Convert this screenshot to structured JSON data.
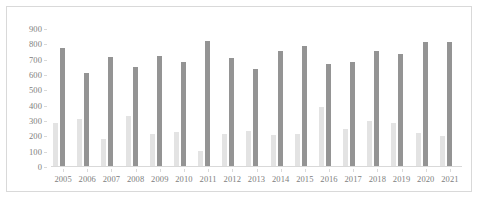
{
  "chart_data": {
    "type": "bar",
    "title": "",
    "subtitle": "",
    "xlabel": "",
    "ylabel": "",
    "categories": [
      "2005",
      "2006",
      "2007",
      "2008",
      "2009",
      "2010",
      "2011",
      "2012",
      "2013",
      "2014",
      "2015",
      "2016",
      "2017",
      "2018",
      "2019",
      "2020",
      "2021"
    ],
    "series": [
      {
        "name": "series-1-light",
        "color": "#e3e3e3",
        "values": [
          290,
          315,
          185,
          330,
          215,
          228,
          105,
          218,
          232,
          210,
          215,
          390,
          245,
          300,
          290,
          225,
          205
        ]
      },
      {
        "name": "series-2-dark",
        "color": "#949494",
        "values": [
          775,
          612,
          715,
          650,
          725,
          682,
          822,
          712,
          640,
          755,
          790,
          672,
          682,
          755,
          740,
          815,
          818
        ]
      }
    ],
    "ylim": [
      0,
      900
    ],
    "ytick_values": [
      0,
      100,
      200,
      300,
      400,
      500,
      600,
      700,
      800,
      900
    ],
    "ytick_labels": [
      "0",
      "100",
      "200",
      "300",
      "400",
      "500",
      "600",
      "700",
      "800",
      "900"
    ],
    "grid": false,
    "legend": "none",
    "legend_position": "none",
    "border_color": "#d9d9d9",
    "axis_text_color": "#808080"
  }
}
